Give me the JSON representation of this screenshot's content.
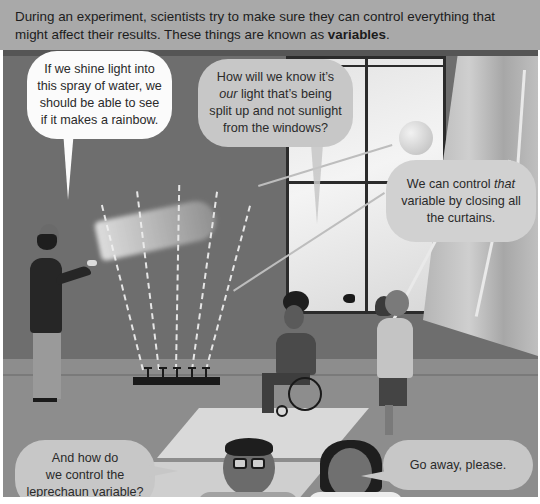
{
  "intro": {
    "text_before": "During an experiment, scientists try to make sure they can control everything that might affect their results. These things are known as ",
    "bold_word": "variables",
    "text_after": "."
  },
  "scene": {
    "description": "Illustrated lab scene: a bearded man shines a flashlight into a water spray, a person in a wheelchair, a person closing curtains, and two people in the foreground."
  },
  "bubbles": [
    {
      "id": "flashlight-man",
      "lines": [
        "If we shine light into",
        "this spray of water, we",
        "should be able to see",
        "if it makes a rainbow."
      ]
    },
    {
      "id": "wheelchair-person",
      "line1_pre": "How will we know it’s",
      "line2_italic": "our",
      "line2_post": " light that’s being",
      "line3": "split up and not sunlight",
      "line4": "from the windows?"
    },
    {
      "id": "curtain-person",
      "line1_pre": "We can control ",
      "line1_italic": "that",
      "line2": "variable by closing all",
      "line3": "the curtains."
    },
    {
      "id": "glasses-person",
      "lines": [
        "And how do",
        "we control the",
        "leprechaun variable?"
      ]
    },
    {
      "id": "labcoat-person",
      "lines": [
        "Go away, please."
      ]
    }
  ],
  "colors": {
    "intro_bg": "#a9a9a9",
    "wall": "#6e6e6e",
    "floor": "#8d8d8d",
    "bubble_white": "#fbfbfb",
    "bubble_gray": "#c7c7c7"
  }
}
